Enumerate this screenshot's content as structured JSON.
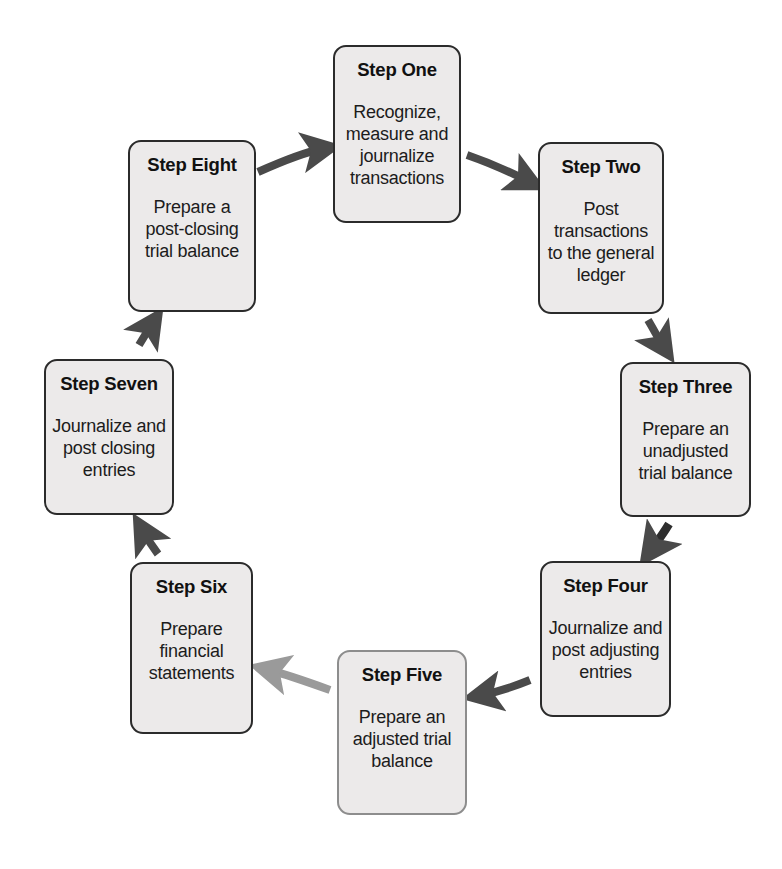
{
  "diagram": {
    "background_color": "#ffffff",
    "box_fill_color": "#eceaea",
    "box_border_color": "#2b2b2b",
    "box_border_color_light": "#8d8d8d",
    "arrow_color_dark": "#4a4a4a",
    "arrow_color_light": "#9a9a9a",
    "steps": [
      {
        "id": "step-one",
        "title": "Step One",
        "description": "Recognize,\nmeasure and\njournalize\ntransactions",
        "x": 333,
        "y": 45,
        "w": 128,
        "h": 178,
        "border": "dark"
      },
      {
        "id": "step-two",
        "title": "Step Two",
        "description": "Post\ntransactions\nto the general\nledger",
        "x": 538,
        "y": 142,
        "w": 126,
        "h": 172,
        "border": "dark"
      },
      {
        "id": "step-three",
        "title": "Step Three",
        "description": "Prepare an\nunadjusted\ntrial balance",
        "x": 620,
        "y": 362,
        "w": 131,
        "h": 155,
        "border": "dark"
      },
      {
        "id": "step-four",
        "title": "Step Four",
        "description": "Journalize and\npost adjusting\nentries",
        "x": 540,
        "y": 561,
        "w": 131,
        "h": 156,
        "border": "dark"
      },
      {
        "id": "step-five",
        "title": "Step Five",
        "description": "Prepare an\nadjusted trial\nbalance",
        "x": 337,
        "y": 650,
        "w": 130,
        "h": 165,
        "border": "light"
      },
      {
        "id": "step-six",
        "title": "Step Six",
        "description": "Prepare\nfinancial\nstatements",
        "x": 130,
        "y": 562,
        "w": 123,
        "h": 172,
        "border": "dark"
      },
      {
        "id": "step-seven",
        "title": "Step Seven",
        "description": "Journalize and\npost closing\nentries",
        "x": 44,
        "y": 359,
        "w": 130,
        "h": 156,
        "border": "dark"
      },
      {
        "id": "step-eight",
        "title": "Step Eight",
        "description": "Prepare a\npost-closing\ntrial balance",
        "x": 128,
        "y": 140,
        "w": 128,
        "h": 172,
        "border": "dark"
      }
    ],
    "arrows": [
      {
        "id": "arrow-eight-to-one",
        "from": "step-eight",
        "to": "step-one",
        "tone": "dark"
      },
      {
        "id": "arrow-one-to-two",
        "from": "step-one",
        "to": "step-two",
        "tone": "dark"
      },
      {
        "id": "arrow-two-to-three",
        "from": "step-two",
        "to": "step-three",
        "tone": "dark"
      },
      {
        "id": "arrow-three-to-four",
        "from": "step-three",
        "to": "step-four",
        "tone": "dark"
      },
      {
        "id": "arrow-four-to-five",
        "from": "step-four",
        "to": "step-five",
        "tone": "dark"
      },
      {
        "id": "arrow-five-to-six",
        "from": "step-five",
        "to": "step-six",
        "tone": "light"
      },
      {
        "id": "arrow-six-to-seven",
        "from": "step-six",
        "to": "step-seven",
        "tone": "dark"
      },
      {
        "id": "arrow-seven-to-eight",
        "from": "step-seven",
        "to": "step-eight",
        "tone": "dark"
      }
    ]
  }
}
